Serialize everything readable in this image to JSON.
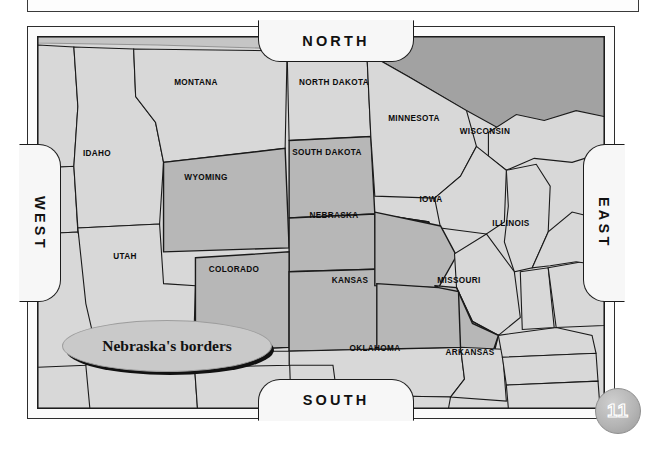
{
  "page": {
    "number": "11",
    "background_color": "#ffffff"
  },
  "top_stub": {
    "name": "empty-panel"
  },
  "map": {
    "title_context": "Nebraska's borders",
    "frame_color": "#1c1c1c",
    "land_color": "#d8d8d8",
    "highlight_color": "#b7b7b7",
    "water_color": "#a8a8a8",
    "direction_tabs": [
      {
        "id": "north",
        "label": "NORTH"
      },
      {
        "id": "south",
        "label": "SOUTH"
      },
      {
        "id": "west",
        "label": "WEST"
      },
      {
        "id": "east",
        "label": "EAST"
      }
    ],
    "callout": {
      "text": "Nebraska's borders",
      "shape": "oval",
      "fill": "#c9c9c9"
    },
    "states": [
      {
        "name": "MONTANA",
        "x": 196,
        "y": 82,
        "highlighted": false
      },
      {
        "name": "NORTH DAKOTA",
        "x": 334,
        "y": 82,
        "highlighted": false
      },
      {
        "name": "MINNESOTA",
        "x": 414,
        "y": 118,
        "highlighted": false
      },
      {
        "name": "WISCONSIN",
        "x": 485,
        "y": 131,
        "highlighted": false
      },
      {
        "name": "IDAHO",
        "x": 97,
        "y": 153,
        "highlighted": false
      },
      {
        "name": "SOUTH DAKOTA",
        "x": 327,
        "y": 152,
        "highlighted": true
      },
      {
        "name": "WYOMING",
        "x": 206,
        "y": 177,
        "highlighted": true
      },
      {
        "name": "NEBRASKA",
        "x": 334,
        "y": 215,
        "highlighted": true
      },
      {
        "name": "IOWA",
        "x": 431,
        "y": 199,
        "highlighted": true
      },
      {
        "name": "ILLINOIS",
        "x": 511,
        "y": 223,
        "highlighted": false
      },
      {
        "name": "UTAH",
        "x": 125,
        "y": 256,
        "highlighted": false
      },
      {
        "name": "COLORADO",
        "x": 234,
        "y": 269,
        "highlighted": true
      },
      {
        "name": "KANSAS",
        "x": 350,
        "y": 280,
        "highlighted": true
      },
      {
        "name": "MISSOURI",
        "x": 459,
        "y": 280,
        "highlighted": true
      },
      {
        "name": "OKLAHOMA",
        "x": 375,
        "y": 348,
        "highlighted": false
      },
      {
        "name": "ARKANSAS",
        "x": 470,
        "y": 352,
        "highlighted": false
      }
    ]
  }
}
